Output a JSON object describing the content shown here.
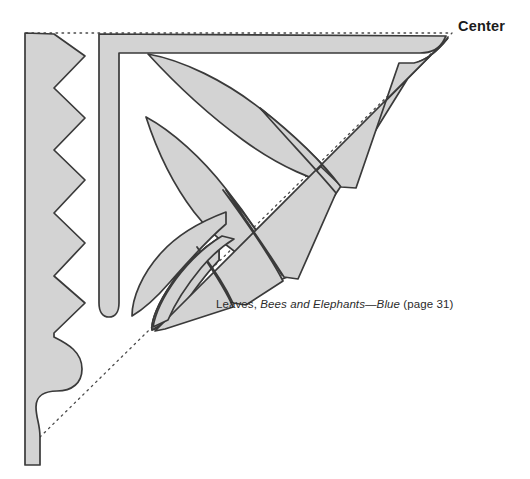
{
  "figure": {
    "kind": "quilting-pattern-template",
    "center_label": "Center",
    "caption": {
      "prefix": "Leaves, ",
      "title": "Bees and Elephants—Blue",
      "suffix": " (page 31)",
      "full_text": "Leaves, Bees and Elephants—Blue (page 31)"
    },
    "colors": {
      "fill": "#d3d3d3",
      "stroke": "#3a3a3a",
      "background": "#ffffff",
      "dotted_line": "#4a4a4a",
      "caption_text": "#2b2b2b",
      "label_text": "#1b1b1b"
    },
    "guides": {
      "top_dotted_label": "top fold guide",
      "diagonal_dotted_label": "diagonal fold guide"
    },
    "shapes": [
      {
        "name": "zigzag-border-strip",
        "count": 1
      },
      {
        "name": "l-shaped-stem",
        "count": 1
      },
      {
        "name": "leaf-upper",
        "count": 1
      },
      {
        "name": "leaf-middle",
        "count": 1
      },
      {
        "name": "leaf-lower",
        "count": 1
      },
      {
        "name": "diagonal-band",
        "count": 1
      }
    ]
  }
}
